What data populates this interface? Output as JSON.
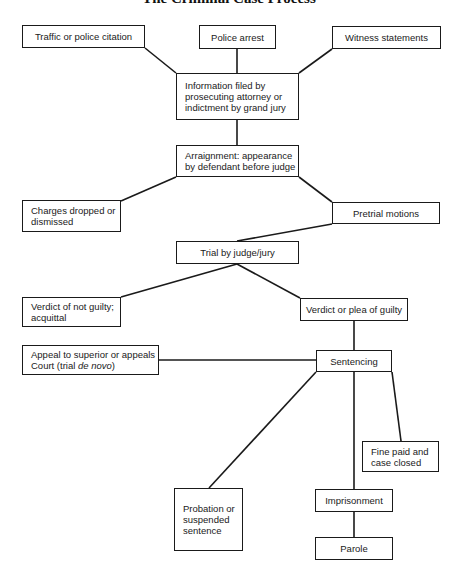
{
  "title": "The Criminal Case Process",
  "nodes": {
    "traffic": {
      "label": "Traffic or police citation"
    },
    "arrest": {
      "label": "Police arrest"
    },
    "witness": {
      "label": "Witness statements"
    },
    "information": {
      "label": "Information filed by prosecuting attorney or indictment by grand jury"
    },
    "arraignment": {
      "label": "Arraignment: appearance by defendant before judge"
    },
    "charges_dropped": {
      "label": "Charges dropped or dismissed"
    },
    "pretrial": {
      "label": "Pretrial motions"
    },
    "trial": {
      "label": "Trial by judge/jury"
    },
    "not_guilty": {
      "label": "Verdict of not guilty; acquittal"
    },
    "guilty": {
      "label": "Verdict or plea of guilty"
    },
    "appeal": {
      "label_prefix": "Appeal to superior or appeals Court (trial ",
      "label_italic": "de novo",
      "label_suffix": ")"
    },
    "sentencing": {
      "label": "Sentencing"
    },
    "fine": {
      "label": "Fine paid and case closed"
    },
    "probation": {
      "label": "Probation or suspended sentence"
    },
    "imprisonment": {
      "label": "Imprisonment"
    },
    "parole": {
      "label": "Parole"
    }
  },
  "edges": [
    [
      "traffic",
      "information"
    ],
    [
      "arrest",
      "information"
    ],
    [
      "witness",
      "information"
    ],
    [
      "information",
      "arraignment"
    ],
    [
      "arraignment",
      "charges_dropped"
    ],
    [
      "arraignment",
      "pretrial"
    ],
    [
      "pretrial",
      "trial"
    ],
    [
      "trial",
      "not_guilty"
    ],
    [
      "trial",
      "guilty"
    ],
    [
      "guilty",
      "sentencing"
    ],
    [
      "sentencing",
      "appeal"
    ],
    [
      "sentencing",
      "probation"
    ],
    [
      "sentencing",
      "imprisonment"
    ],
    [
      "sentencing",
      "fine"
    ],
    [
      "imprisonment",
      "parole"
    ]
  ]
}
